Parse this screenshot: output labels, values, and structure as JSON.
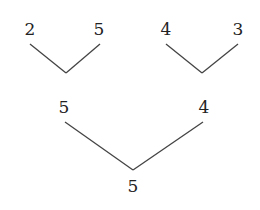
{
  "diagram": {
    "type": "tree",
    "level1": [
      {
        "left": "2",
        "right": "5"
      },
      {
        "left": "4",
        "right": "3"
      }
    ],
    "level2": {
      "left": "5",
      "right": "4"
    },
    "root": "5"
  }
}
